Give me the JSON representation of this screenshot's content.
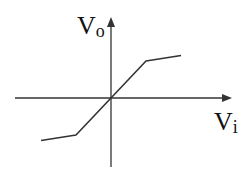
{
  "diagram": {
    "y_axis_label": {
      "main": "V",
      "sub": "o"
    },
    "x_axis_label": {
      "main": "V",
      "sub": "i"
    },
    "curve": {
      "description": "Piecewise-linear transfer curve through origin with reduced slope beyond breakpoints (soft limiter)",
      "points": [
        {
          "vi": -2.0,
          "vo": -1.15
        },
        {
          "vi": -1.0,
          "vo": -1.0
        },
        {
          "vi": 0.0,
          "vo": 0.0
        },
        {
          "vi": 1.0,
          "vo": 1.0
        },
        {
          "vi": 2.0,
          "vo": 1.15
        }
      ]
    },
    "colors": {
      "line": "#333333",
      "axis": "#333333",
      "text": "#111111"
    }
  }
}
